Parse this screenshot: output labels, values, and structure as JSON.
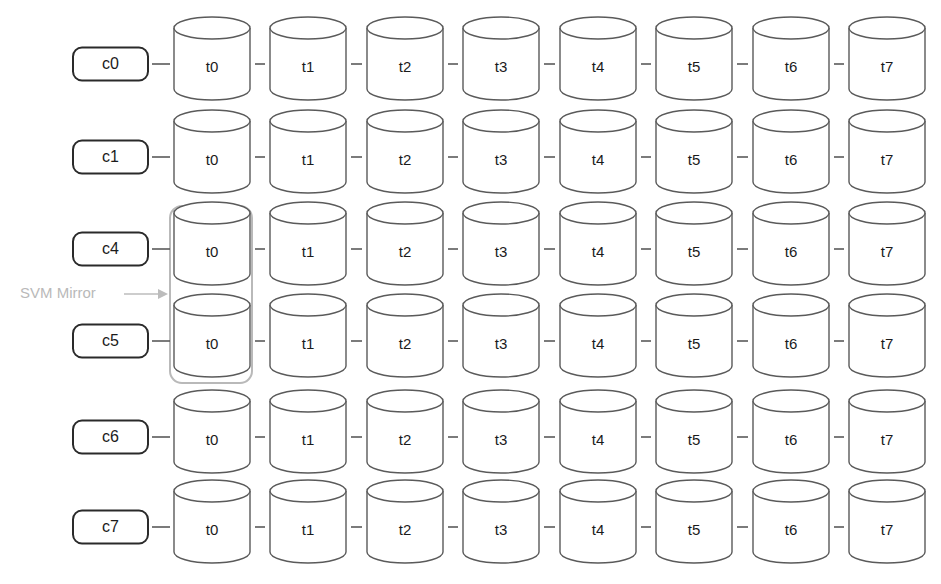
{
  "diagram": {
    "background_color": "#ffffff",
    "node_stroke_color": "#2a2a2a",
    "cylinder_stroke_color": "#5a5a5a",
    "annotation_color": "#b9b9b9",
    "group_stroke_color": "#b9b9b9",
    "tier_labels": [
      "t0",
      "t1",
      "t2",
      "t3",
      "t4",
      "t5",
      "t6",
      "t7"
    ],
    "rows": [
      {
        "node": "c0",
        "tiers": [
          "t0",
          "t1",
          "t2",
          "t3",
          "t4",
          "t5",
          "t6",
          "t7"
        ]
      },
      {
        "node": "c1",
        "tiers": [
          "t0",
          "t1",
          "t2",
          "t3",
          "t4",
          "t5",
          "t6",
          "t7"
        ]
      },
      {
        "node": "c4",
        "tiers": [
          "t0",
          "t1",
          "t2",
          "t3",
          "t4",
          "t5",
          "t6",
          "t7"
        ]
      },
      {
        "node": "c5",
        "tiers": [
          "t0",
          "t1",
          "t2",
          "t3",
          "t4",
          "t5",
          "t6",
          "t7"
        ]
      },
      {
        "node": "c6",
        "tiers": [
          "t0",
          "t1",
          "t2",
          "t3",
          "t4",
          "t5",
          "t6",
          "t7"
        ]
      },
      {
        "node": "c7",
        "tiers": [
          "t0",
          "t1",
          "t2",
          "t3",
          "t4",
          "t5",
          "t6",
          "t7"
        ]
      }
    ],
    "annotation": {
      "label": "SVM Mirror",
      "points_to": "group-highlight-t0-c4-c5",
      "arrow_icon": "arrow-right-icon"
    },
    "group_highlight": {
      "name": "SVM Mirror group",
      "covers_rows": [
        "c4",
        "c5"
      ],
      "covers_tier": "t0"
    }
  },
  "geometry": {
    "row_y": [
      64,
      157,
      249,
      341,
      437,
      527
    ],
    "col_x": [
      212,
      308,
      405,
      501,
      598,
      694,
      791,
      887
    ],
    "cyl_w": 76,
    "cyl_h": 72,
    "ellipse_ry": 11,
    "box": {
      "x": 73,
      "y": 42,
      "w": 75,
      "h": 33,
      "r": 9
    },
    "group": {
      "x": 170,
      "y": 206,
      "w": 82,
      "h": 177,
      "r": 12
    },
    "annotation_text_xy": [
      20,
      294
    ],
    "annotation_arrow": {
      "x1": 124,
      "x2": 168,
      "y": 294
    }
  }
}
